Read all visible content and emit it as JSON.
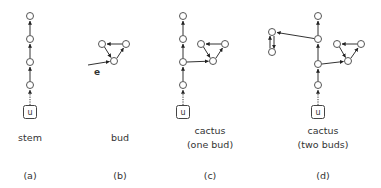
{
  "figure": {
    "panels": [
      {
        "id": "a",
        "title": "stem",
        "subtitle": "",
        "tag": "(a)",
        "root_label": "u"
      },
      {
        "id": "b",
        "title": "bud",
        "subtitle": "",
        "tag": "(b)",
        "edge_label": "e"
      },
      {
        "id": "c",
        "title": "cactus",
        "subtitle": "(one bud)",
        "tag": "(c)",
        "root_label": "u"
      },
      {
        "id": "d",
        "title": "cactus",
        "subtitle": "(two buds)",
        "tag": "(d)",
        "root_label": "u"
      }
    ]
  },
  "colors": {
    "stroke": "#333333",
    "node_fill": "#ffffff",
    "text": "#333333"
  }
}
